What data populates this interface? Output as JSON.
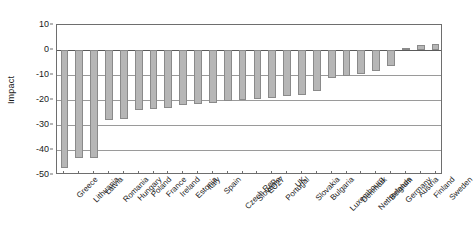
{
  "chart_data": {
    "type": "bar",
    "title": "",
    "xlabel": "",
    "ylabel": "Impact",
    "ylim": [
      -50,
      10
    ],
    "yticks": [
      10,
      0,
      -10,
      -20,
      -30,
      -40,
      -50
    ],
    "ytick_labels": [
      "10",
      "0",
      "-10",
      "-20",
      "-30",
      "-40",
      "-50"
    ],
    "grid": true,
    "legend": "none",
    "bar_color": "#b6b6b6",
    "bar_edge_color": "#8a8a8a",
    "categories": [
      "Greece",
      "Lithuania",
      "Latvia",
      "Romania",
      "Hungary",
      "Poland",
      "France",
      "Ireland",
      "Estonia",
      "Italy",
      "Spain",
      "Czech Rep.",
      "Slovenia",
      "EU27",
      "Portugal",
      "UK",
      "Slovakia",
      "Bulgaria",
      "Luxembourg",
      "Denmark",
      "Netherlands",
      "Belgium",
      "Germany",
      "Austria",
      "Finland",
      "Sweden"
    ],
    "values": [
      -47.0,
      -43.0,
      -43.0,
      -28.0,
      -27.5,
      -24.0,
      -23.5,
      -23.0,
      -22.0,
      -21.5,
      -21.0,
      -20.5,
      -20.0,
      -19.5,
      -19.0,
      -18.5,
      -18.0,
      -16.5,
      -11.0,
      -10.5,
      -9.5,
      -8.5,
      -6.5,
      0.8,
      2.0,
      2.5
    ]
  }
}
